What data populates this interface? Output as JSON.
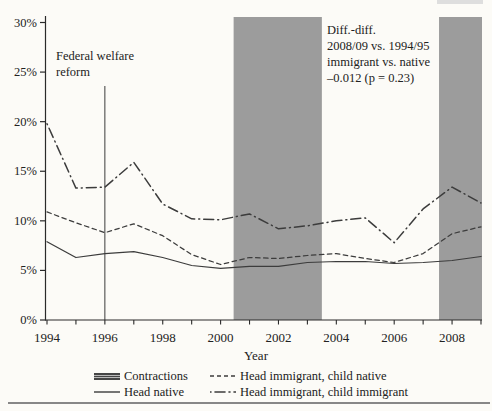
{
  "colors": {
    "band": "#9c9c9c",
    "line": "#3c3c3c",
    "ink": "#2a2a2a",
    "background": "#fcfbf7",
    "rule": "#878787"
  },
  "chart_data": {
    "type": "line",
    "title": "",
    "xlabel": "Year",
    "ylabel": "",
    "xlim": [
      1994,
      2009.05
    ],
    "ylim": [
      0,
      30
    ],
    "grid": "off",
    "legend_position": "bottom",
    "x_ticks": [
      1994,
      1996,
      1998,
      2000,
      2002,
      2004,
      2006,
      2008
    ],
    "y_tick_labels": [
      "0%",
      "5%",
      "10%",
      "15%",
      "20%",
      "25%",
      "30%"
    ],
    "years": [
      1994,
      1995,
      1996,
      1997,
      1998,
      1999,
      2000,
      2001,
      2002,
      2003,
      2004,
      2005,
      2006,
      2007,
      2008,
      2009
    ],
    "series": [
      {
        "name": "Head native",
        "style": "solid",
        "values": [
          7.9,
          6.3,
          6.7,
          6.9,
          6.3,
          5.5,
          5.2,
          5.4,
          5.4,
          5.8,
          5.9,
          5.9,
          5.7,
          5.8,
          6.0,
          6.4
        ]
      },
      {
        "name": "Head immigrant, child native",
        "style": "dashed",
        "values": [
          10.9,
          9.8,
          8.8,
          9.7,
          8.5,
          6.6,
          5.6,
          6.3,
          6.2,
          6.5,
          6.7,
          6.2,
          5.8,
          6.7,
          8.7,
          9.4
        ]
      },
      {
        "name": "Head immigrant, child immigrant",
        "style": "dashdot",
        "values": [
          19.8,
          13.3,
          13.4,
          15.9,
          11.7,
          10.2,
          10.1,
          10.7,
          9.2,
          9.5,
          10.0,
          10.3,
          7.8,
          11.2,
          13.4,
          11.8
        ]
      }
    ],
    "contractions_label": "Contractions",
    "contractions": [
      [
        2000.45,
        2003.5
      ],
      [
        2007.55,
        2009.05
      ]
    ],
    "event_line": {
      "year": 1996,
      "label_lines": [
        "Federal welfare",
        "reform"
      ]
    },
    "annotation_lines": [
      "Diff.-diff.",
      "2008/09 vs. 1994/95",
      "immigrant vs. native",
      "–0.012 (p = 0.23)"
    ]
  }
}
